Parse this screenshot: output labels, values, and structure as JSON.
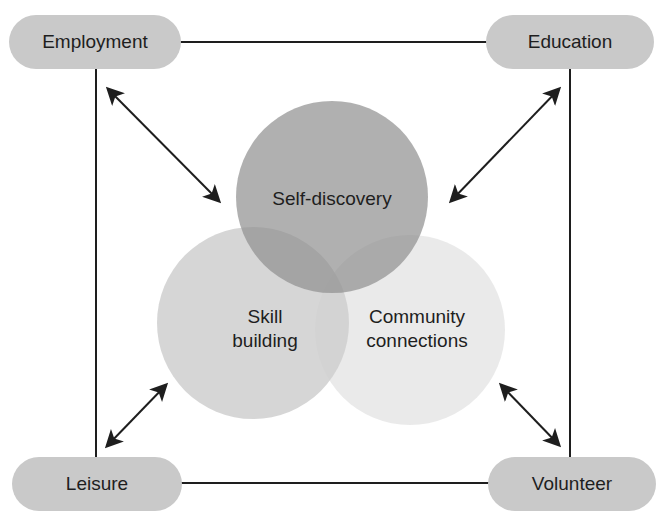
{
  "corners": {
    "top_left": {
      "label": "Employment"
    },
    "top_right": {
      "label": "Education"
    },
    "bottom_left": {
      "label": "Leisure"
    },
    "bottom_right": {
      "label": "Volunteer"
    }
  },
  "venn": {
    "top": {
      "label": "Self-discovery",
      "color": "#a9a9a9"
    },
    "left": {
      "line1": "Skill",
      "line2": "building",
      "color": "#d3d3d3"
    },
    "right": {
      "line1": "Community",
      "line2": "connections",
      "color": "#ececec"
    }
  },
  "colors": {
    "pill_fill": "#c9c9c9",
    "line": "#1e1e1e"
  }
}
